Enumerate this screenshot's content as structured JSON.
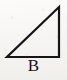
{
  "figure": {
    "name": "right-triangle-figure",
    "label": "B",
    "background_color": "#f7f6f3",
    "stroke_color": "#16161a",
    "stroke_width_px": 2.2,
    "canvas": {
      "width_px": 67,
      "height_px": 80
    },
    "shape": {
      "type": "right-triangle",
      "right_angle_at": "bottom-right",
      "vertices": [
        {
          "name": "bottom-left-vertex",
          "x": 7,
          "y": 57
        },
        {
          "name": "bottom-right-vertex",
          "x": 59,
          "y": 57
        },
        {
          "name": "top-right-apex",
          "x": 59,
          "y": 7
        }
      ],
      "edges": [
        {
          "name": "base-edge",
          "from": "bottom-left-vertex",
          "to": "bottom-right-vertex",
          "orientation": "horizontal"
        },
        {
          "name": "vertical-leg-edge",
          "from": "bottom-right-vertex",
          "to": "top-right-apex",
          "orientation": "vertical"
        },
        {
          "name": "hypotenuse-edge",
          "from": "top-right-apex",
          "to": "bottom-left-vertex",
          "orientation": "diagonal"
        }
      ],
      "points_path": "7,57 59,57 59,7"
    }
  }
}
